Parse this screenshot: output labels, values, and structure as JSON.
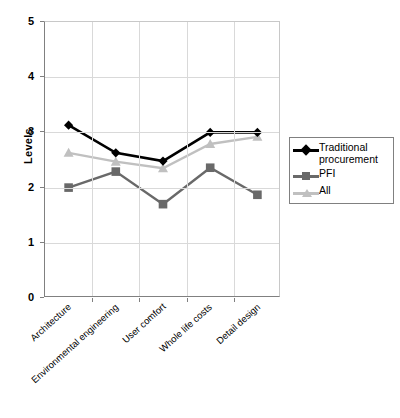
{
  "chart_data": {
    "type": "line",
    "title": "",
    "xlabel": "",
    "ylabel": "Levels",
    "ylim": [
      0,
      5
    ],
    "yticks": [
      0,
      1,
      2,
      3,
      4,
      5
    ],
    "ytick_labels": [
      "0",
      "1",
      "2",
      "3",
      "4",
      "5"
    ],
    "grid": true,
    "legend_position": "right",
    "categories": [
      "Architecture",
      "Environmental engineering",
      "User comfort",
      "Whole life costs",
      "Detail design"
    ],
    "series": [
      {
        "name": "Traditional procurement",
        "color": "#000000",
        "marker": "diamond",
        "values": [
          3.13,
          2.63,
          2.48,
          3.0,
          3.0
        ]
      },
      {
        "name": "PFI",
        "color": "#696969",
        "marker": "square",
        "values": [
          2.0,
          2.29,
          1.7,
          2.36,
          1.87
        ]
      },
      {
        "name": "All",
        "color": "#c0c0c0",
        "marker": "triangle",
        "values": [
          2.63,
          2.47,
          2.35,
          2.79,
          2.92
        ]
      }
    ]
  },
  "legend": {
    "entries": [
      {
        "label": "Traditional procurement"
      },
      {
        "label": "PFI"
      },
      {
        "label": "All"
      }
    ]
  },
  "colors": {
    "traditional": "#000000",
    "pfi": "#696969",
    "all": "#c0c0c0",
    "axis": "#808080",
    "grid": "#d9d9d9",
    "background": "#ffffff"
  }
}
